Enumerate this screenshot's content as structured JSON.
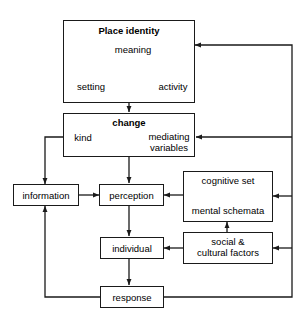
{
  "diagram": {
    "colors": {
      "line": "#1a1a1a",
      "background": "#ffffff",
      "text": "#000000"
    },
    "boxes": [
      {
        "id": "place-identity",
        "heading": "Place identity",
        "items": [
          "meaning",
          "setting",
          "activity"
        ]
      },
      {
        "id": "change",
        "heading": "change",
        "items": [
          "kind",
          "mediating variables"
        ]
      },
      {
        "id": "information",
        "label": "information"
      },
      {
        "id": "perception",
        "label": "perception"
      },
      {
        "id": "cognitive-mental",
        "items": [
          "cognitive set",
          "mental schemata"
        ]
      },
      {
        "id": "individual",
        "label": "individual"
      },
      {
        "id": "social-cultural",
        "label": "social & cultural factors"
      },
      {
        "id": "response",
        "label": "response"
      }
    ],
    "labels": {
      "place_identity": "Place identity",
      "meaning": "meaning",
      "setting": "setting",
      "activity": "activity",
      "change": "change",
      "kind": "kind",
      "mediating": "mediating",
      "variables": "variables",
      "information": "information",
      "perception": "perception",
      "cognitive_set": "cognitive set",
      "mental_schemata": "mental schemata",
      "individual": "individual",
      "social_amp": "social &",
      "cultural_factors": "cultural factors",
      "response": "response"
    },
    "connectors": [
      {
        "from": "meaning",
        "to": "setting",
        "type": "double-arrow"
      },
      {
        "from": "meaning",
        "to": "activity",
        "type": "double-arrow"
      },
      {
        "from": "setting",
        "to": "activity",
        "type": "double-arrow"
      },
      {
        "from": "place-identity",
        "to": "change",
        "type": "arrow"
      },
      {
        "from": "kind",
        "to": "mediating variables",
        "type": "double-arrow"
      },
      {
        "from": "change",
        "to": "perception",
        "type": "double-arrow"
      },
      {
        "from": "kind",
        "to": "information",
        "type": "arrow"
      },
      {
        "from": "information",
        "to": "perception",
        "type": "arrow"
      },
      {
        "from": "cognitive set",
        "to": "mental schemata",
        "type": "double-arrow"
      },
      {
        "from": "cognitive-mental",
        "to": "perception",
        "type": "arrow"
      },
      {
        "from": "social-cultural",
        "to": "cognitive-mental",
        "type": "arrow"
      },
      {
        "from": "social-cultural",
        "to": "individual",
        "type": "arrow"
      },
      {
        "from": "perception",
        "to": "individual",
        "type": "arrow"
      },
      {
        "from": "individual",
        "to": "response",
        "type": "arrow"
      },
      {
        "from": "response",
        "to": "information",
        "type": "arrow"
      },
      {
        "from": "response",
        "to": "place-identity",
        "type": "arrow"
      },
      {
        "from": "response",
        "to": "change",
        "type": "arrow"
      },
      {
        "from": "response",
        "to": "cognitive-mental",
        "type": "arrow"
      },
      {
        "from": "response",
        "to": "social-cultural",
        "type": "arrow"
      }
    ]
  }
}
